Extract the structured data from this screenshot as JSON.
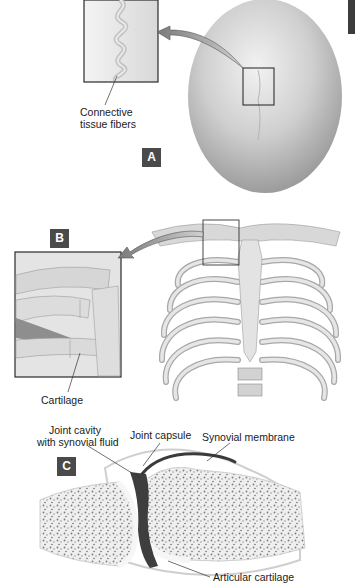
{
  "figure": {
    "panels": [
      {
        "id": "A",
        "tag": "A",
        "subject": "skull (top view) with suture",
        "inset": "magnified suture",
        "labels": [
          "Connective",
          "tissue fibers"
        ]
      },
      {
        "id": "B",
        "tag": "B",
        "subject": "rib cage (anterior view)",
        "inset": "magnified sternocostal joint",
        "labels": [
          "Cartilage"
        ]
      },
      {
        "id": "C",
        "tag": "C",
        "subject": "synovial joint cross-section",
        "labels": [
          "Joint cavity",
          "with synovial fluid",
          "Joint capsule",
          "Synovial membrane",
          "Articular cartilage"
        ]
      }
    ]
  },
  "colors": {
    "tag_bg": "#4a4a4a",
    "tag_text": "#ffffff",
    "bone": "#d9d9d9",
    "bone_dark": "#9a9a9a",
    "frame": "#2a2a2a",
    "label_text": "#1a1a1a"
  }
}
